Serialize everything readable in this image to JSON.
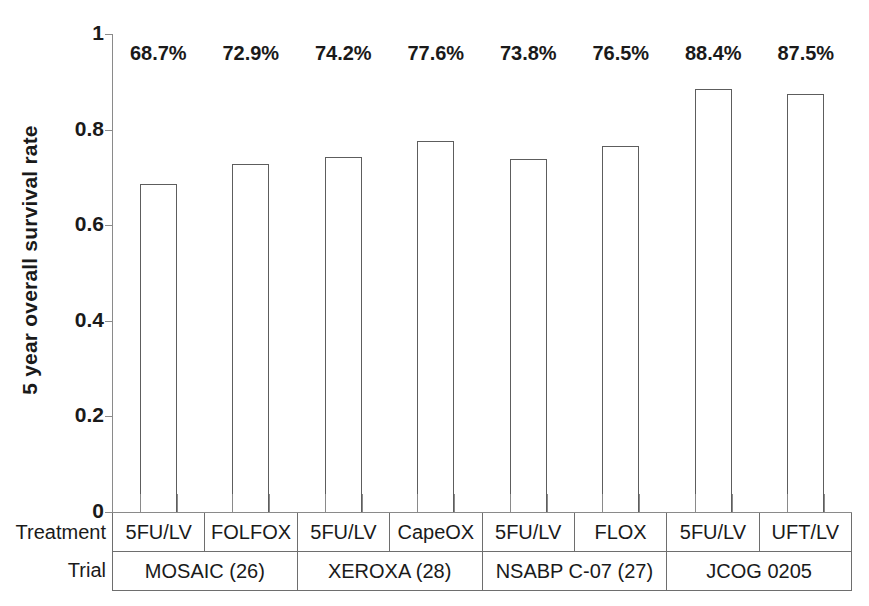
{
  "chart_data": {
    "type": "bar",
    "title": "",
    "xlabel": "",
    "ylabel": "5 year overall survival rate",
    "ylim": [
      0,
      1
    ],
    "ytick_labels": [
      "1",
      "0.8",
      "0.6",
      "0.4",
      "0.2",
      "0"
    ],
    "ytick_values": [
      1,
      0.8,
      0.6,
      0.4,
      0.2,
      0
    ],
    "grid": false,
    "legend": "none",
    "categories": [
      "5FU/LV",
      "FOLFOX",
      "5FU/LV",
      "CapeOX",
      "5FU/LV",
      "FLOX",
      "5FU/LV",
      "UFT/LV"
    ],
    "values": [
      0.687,
      0.729,
      0.742,
      0.776,
      0.738,
      0.765,
      0.884,
      0.875
    ],
    "data_labels": [
      "68.7%",
      "72.9%",
      "74.2%",
      "77.6%",
      "73.8%",
      "76.5%",
      "88.4%",
      "87.5%"
    ],
    "bar_style": {
      "fill": "#ffffff",
      "edge": "#5d5d5d"
    },
    "groups": [
      {
        "label": "MOSAIC (26)",
        "span": 2
      },
      {
        "label": "XEROXA (28)",
        "span": 2
      },
      {
        "label": "NSABP C-07 (27)",
        "span": 2
      },
      {
        "label": "JCOG 0205",
        "span": 2
      }
    ]
  },
  "axis": {
    "y_title": "5 year overall survival rate",
    "y_ticks": [
      "1",
      "0.8",
      "0.6",
      "0.4",
      "0.2",
      "0"
    ]
  },
  "table": {
    "treatment_row_label": "Treatment",
    "trial_row_label": "Trial",
    "treatments": [
      "5FU/LV",
      "FOLFOX",
      "5FU/LV",
      "CapeOX",
      "5FU/LV",
      "FLOX",
      "5FU/LV",
      "UFT/LV"
    ],
    "trials": [
      "MOSAIC (26)",
      "XEROXA (28)",
      "NSABP C-07 (27)",
      "JCOG 0205"
    ]
  },
  "labels": {
    "values": [
      "68.7%",
      "72.9%",
      "74.2%",
      "77.6%",
      "73.8%",
      "76.5%",
      "88.4%",
      "87.5%"
    ]
  }
}
